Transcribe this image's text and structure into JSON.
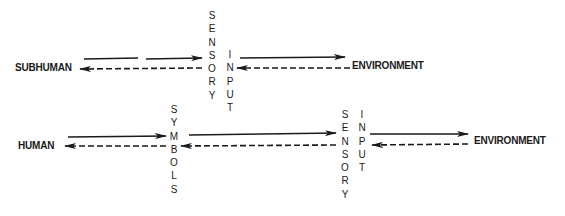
{
  "top_row": {
    "left_label": "SUBHUMAN",
    "right_label": "ENVIRONMENT",
    "column_sensory": "SENSORY",
    "column_input": "INPUT"
  },
  "bottom_row": {
    "left_label": "HUMAN",
    "right_label": "ENVIRONMENT",
    "column_symbols": "SYMBOLS",
    "column_sensory": "SENSORY",
    "column_input": "INPUT"
  },
  "legend": {
    "solid_arrow": "forward flow",
    "dashed_arrow": "return flow"
  },
  "colors": {
    "ink": "#1a1a1a",
    "background": "#ffffff"
  }
}
